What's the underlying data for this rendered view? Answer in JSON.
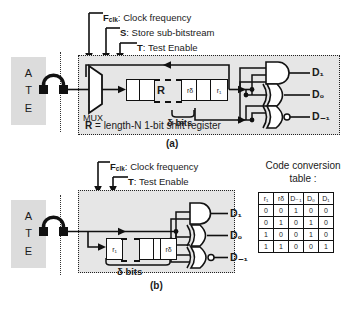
{
  "figure": {
    "panel_a": {
      "caption": "(a)",
      "ate_letters": [
        "A",
        "T",
        "E"
      ],
      "signals": [
        {
          "symbol": "F",
          "subscript": "clk",
          "desc": ": Clock frequency"
        },
        {
          "symbol": "S",
          "subscript": "",
          "desc": ": Store sub-bitstream"
        },
        {
          "symbol": "T",
          "subscript": "",
          "desc": ": Test Enable"
        }
      ],
      "mux_label": "MUX",
      "register_label": "R",
      "register_cells": [
        "",
        "",
        "rδ",
        "",
        "r₁"
      ],
      "delta_label": "δ bits",
      "note": "R = length-N 1-bit shift register",
      "note_prefix": "R",
      "note_rest": " = length-N 1-bit shift register",
      "outputs": [
        {
          "label": "D₁",
          "gate": "and-gate"
        },
        {
          "label": "D₀",
          "gate": "xor-gate"
        },
        {
          "label": "D₋₁",
          "gate": "nor-gate"
        }
      ]
    },
    "panel_b": {
      "caption": "(b)",
      "ate_letters": [
        "A",
        "T",
        "E"
      ],
      "signals": [
        {
          "symbol": "F",
          "subscript": "clk",
          "desc": ": Clock frequency"
        },
        {
          "symbol": "T",
          "subscript": "",
          "desc": ": Test Enable"
        }
      ],
      "register_cells": [
        "r₁",
        "",
        "",
        "rδ"
      ],
      "delta_label": "δ bits",
      "outputs": [
        {
          "label": "D₁",
          "gate": "and-gate"
        },
        {
          "label": "D₀",
          "gate": "xor-gate"
        },
        {
          "label": "D₋₁",
          "gate": "nor-gate"
        }
      ]
    }
  },
  "code_conversion_table": {
    "title_line1": "Code conversion",
    "title_line2": "table :",
    "headers": [
      "r₁",
      "rδ",
      "D₋₁",
      "D₀",
      "D₁"
    ],
    "rows": [
      [
        "0",
        "0",
        "1",
        "0",
        "0"
      ],
      [
        "0",
        "1",
        "0",
        "1",
        "0"
      ],
      [
        "1",
        "0",
        "0",
        "1",
        "0"
      ],
      [
        "1",
        "1",
        "0",
        "0",
        "1"
      ]
    ]
  },
  "colors": {
    "panel_fill": "#e6e6e6",
    "ate_fill": "#dcdcdc",
    "line": "#111111",
    "background": "#ffffff"
  }
}
